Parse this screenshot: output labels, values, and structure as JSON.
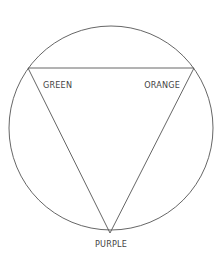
{
  "diagram": {
    "type": "color-triangle-in-circle",
    "stroke_color": "#555555",
    "circle": {
      "cx": 111,
      "cy": 128,
      "r": 102
    },
    "triangle": {
      "vertices": [
        {
          "name": "top-left",
          "x": 28,
          "y": 68
        },
        {
          "name": "top-right",
          "x": 194,
          "y": 68
        },
        {
          "name": "bottom",
          "x": 110,
          "y": 233
        }
      ]
    },
    "labels": {
      "green": "GREEN",
      "orange": "ORANGE",
      "purple": "PURPLE"
    }
  }
}
